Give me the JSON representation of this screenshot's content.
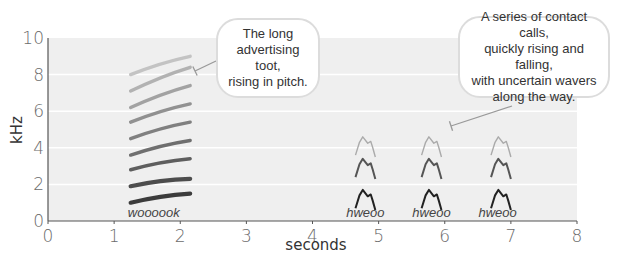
{
  "title": "",
  "callouts": [
    {
      "id": "toot",
      "lines": [
        "The long",
        "advertising toot,",
        "rising in pitch."
      ]
    },
    {
      "id": "contact",
      "lines": [
        "A series of contact calls,",
        "quickly rising and falling,",
        "with uncertain wavers",
        "along the way."
      ]
    }
  ],
  "chart_data": {
    "type": "spectrogram",
    "title": "",
    "xlabel": "seconds",
    "ylabel": "kHz",
    "xlim": [
      0,
      8
    ],
    "ylim": [
      0,
      10
    ],
    "xticks": [
      0,
      1,
      2,
      3,
      4,
      5,
      6,
      7,
      8
    ],
    "yticks": [
      0,
      2,
      4,
      6,
      8,
      10
    ],
    "grid": "horizontal at 2, 4, 6, 8 kHz",
    "background": "#efefef",
    "calls": [
      {
        "label": "woooook",
        "label_x": 1.6,
        "start_s": 1.25,
        "end_s": 2.15,
        "shape": "harmonic stack, rising",
        "harmonics_khz": [
          {
            "start": 1.0,
            "end": 1.5
          },
          {
            "start": 1.9,
            "end": 2.3
          },
          {
            "start": 2.8,
            "end": 3.4
          },
          {
            "start": 3.6,
            "end": 4.4
          },
          {
            "start": 4.5,
            "end": 5.4
          },
          {
            "start": 5.4,
            "end": 6.4
          },
          {
            "start": 6.2,
            "end": 7.4
          },
          {
            "start": 7.1,
            "end": 8.4
          },
          {
            "start": 8.0,
            "end": 9.0
          }
        ]
      },
      {
        "label": "hweoo",
        "label_x": 4.8,
        "start_s": 4.65,
        "end_s": 4.95,
        "shape": "rise-fall",
        "peaks_khz": [
          1.7,
          3.4,
          4.6
        ]
      },
      {
        "label": "hweoo",
        "label_x": 5.8,
        "start_s": 5.65,
        "end_s": 5.95,
        "shape": "rise-fall",
        "peaks_khz": [
          1.7,
          3.4,
          4.6
        ]
      },
      {
        "label": "hweoo",
        "label_x": 6.8,
        "start_s": 6.7,
        "end_s": 7.0,
        "shape": "rise-fall",
        "peaks_khz": [
          1.7,
          3.4,
          4.6
        ]
      }
    ],
    "annotations": [
      "The long advertising toot, rising in pitch.",
      "A series of contact calls, quickly rising and falling, with uncertain wavers along the way."
    ]
  }
}
